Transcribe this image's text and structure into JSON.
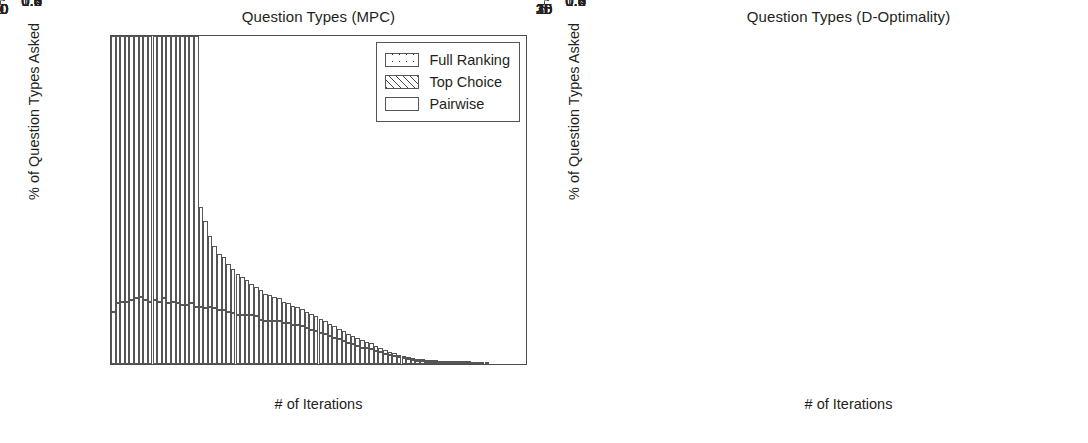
{
  "figure": {
    "width": 1088,
    "height": 443,
    "background": "#ffffff",
    "ink_color": "#231f20",
    "axis_color": "#4d4d4d"
  },
  "chart_data": [
    {
      "id": "mpc",
      "type": "bar",
      "stacked": true,
      "title": "Question Types (MPC)",
      "xlabel": "# of Iterations",
      "ylabel": "% of Question Types Asked",
      "xlim": [
        0,
        90
      ],
      "ylim": [
        0.0,
        1.0
      ],
      "xticks": [
        0,
        10,
        20,
        30,
        40,
        50,
        60,
        70,
        80,
        90
      ],
      "xticklabels": [
        "0",
        "10",
        "20",
        "30",
        "40",
        "50",
        "60",
        "70",
        "80",
        "90"
      ],
      "yticks": [
        0.0,
        0.2,
        0.4,
        0.6,
        0.8,
        1.0
      ],
      "yticklabels": [
        "0.0",
        "0.2",
        "0.4",
        "0.6",
        "0.8",
        "1.0"
      ],
      "grid": false,
      "legend_position": "upper right",
      "legend": [
        "Full Ranking",
        "Top Choice",
        "Pairwise"
      ],
      "x": [
        0,
        1,
        2,
        3,
        4,
        5,
        6,
        7,
        8,
        9,
        10,
        11,
        12,
        13,
        14,
        15,
        16,
        17,
        18,
        19,
        20,
        21,
        22,
        23,
        24,
        25,
        26,
        27,
        28,
        29,
        30,
        31,
        32,
        33,
        34,
        35,
        36,
        37,
        38,
        39,
        40,
        41,
        42,
        43,
        44,
        45,
        46,
        47,
        48,
        49,
        50,
        51,
        52,
        53,
        54,
        55,
        56,
        57,
        58,
        59,
        60,
        61,
        62,
        63,
        64,
        65,
        66,
        67,
        68,
        69,
        70,
        71,
        72,
        73,
        74,
        75,
        76,
        77,
        78,
        79,
        80,
        81
      ],
      "series": [
        {
          "name": "Pairwise",
          "pattern": "blank",
          "values": [
            0.16,
            0.185,
            0.19,
            0.19,
            0.195,
            0.2,
            0.205,
            0.195,
            0.19,
            0.195,
            0.19,
            0.2,
            0.185,
            0.19,
            0.185,
            0.18,
            0.18,
            0.185,
            0.175,
            0.175,
            0.17,
            0.175,
            0.17,
            0.165,
            0.165,
            0.16,
            0.155,
            0.15,
            0.15,
            0.15,
            0.15,
            0.145,
            0.135,
            0.13,
            0.13,
            0.13,
            0.13,
            0.125,
            0.125,
            0.12,
            0.12,
            0.115,
            0.11,
            0.105,
            0.1,
            0.095,
            0.09,
            0.085,
            0.08,
            0.075,
            0.07,
            0.065,
            0.06,
            0.055,
            0.05,
            0.048,
            0.045,
            0.04,
            0.036,
            0.032,
            0.028,
            0.024,
            0.02,
            0.018,
            0.015,
            0.012,
            0.01,
            0.008,
            0.007,
            0.006,
            0.005,
            0.004,
            0.004,
            0.003,
            0.003,
            0.002,
            0.002,
            0.002,
            0.001,
            0.001,
            0.001,
            0.001
          ]
        },
        {
          "name": "Top Choice",
          "pattern": "hatch",
          "values": [
            0.0,
            0.0,
            0.0,
            0.0,
            0.0,
            0.0,
            0.0,
            0.0,
            0.0,
            0.0,
            0.0,
            0.0,
            0.0,
            0.0,
            0.0,
            0.0,
            0.0,
            0.0,
            0.0,
            0.0,
            0.0,
            0.0,
            0.0,
            0.0,
            0.0,
            0.0,
            0.0,
            0.0,
            0.0,
            0.0,
            0.0,
            0.0,
            0.0,
            0.0,
            0.0,
            0.0,
            0.0,
            0.0,
            0.0,
            0.0,
            0.0,
            0.0,
            0.0,
            0.0,
            0.0,
            0.0,
            0.0,
            0.0,
            0.0,
            0.0,
            0.0,
            0.0,
            0.0,
            0.0,
            0.0,
            0.0,
            0.0,
            0.0,
            0.0,
            0.0,
            0.0,
            0.0,
            0.0,
            0.0,
            0.0,
            0.0,
            0.0,
            0.0,
            0.0,
            0.0,
            0.0,
            0.0,
            0.0,
            0.0,
            0.0,
            0.0,
            0.0,
            0.0,
            0.0,
            0.0,
            0.0,
            0.0
          ]
        },
        {
          "name": "Full Ranking",
          "pattern": "dots",
          "values": [
            0.84,
            0.815,
            0.81,
            0.81,
            0.805,
            0.8,
            0.795,
            0.805,
            0.81,
            0.805,
            0.81,
            0.8,
            0.815,
            0.81,
            0.815,
            0.82,
            0.82,
            0.815,
            0.825,
            0.305,
            0.265,
            0.215,
            0.19,
            0.17,
            0.16,
            0.145,
            0.135,
            0.125,
            0.115,
            0.105,
            0.095,
            0.09,
            0.09,
            0.085,
            0.08,
            0.075,
            0.07,
            0.065,
            0.06,
            0.058,
            0.055,
            0.052,
            0.05,
            0.048,
            0.045,
            0.042,
            0.04,
            0.038,
            0.035,
            0.033,
            0.03,
            0.028,
            0.026,
            0.024,
            0.022,
            0.02,
            0.018,
            0.016,
            0.014,
            0.012,
            0.01,
            0.009,
            0.008,
            0.007,
            0.006,
            0.005,
            0.004,
            0.004,
            0.003,
            0.003,
            0.002,
            0.002,
            0.002,
            0.001,
            0.001,
            0.001,
            0.001,
            0.001,
            0.001,
            0.0,
            0.0,
            0.0
          ]
        }
      ]
    },
    {
      "id": "d-optimality",
      "type": "bar",
      "stacked": true,
      "title": "Question Types (D-Optimality)",
      "xlabel": "# of Iterations",
      "ylabel": "% of Question Types Asked",
      "xlim": [
        0,
        35
      ],
      "ylim": [
        0.0,
        1.0
      ],
      "xticks": [
        0,
        5,
        10,
        15,
        20,
        25,
        30,
        35
      ],
      "xticklabels": [
        "0",
        "5",
        "10",
        "15",
        "20",
        "25",
        "30",
        "35"
      ],
      "yticks": [
        0.0,
        0.2,
        0.4,
        0.6,
        0.8,
        1.0
      ],
      "yticklabels": [
        "0.0",
        "0.2",
        "0.4",
        "0.6",
        "0.8",
        "1.0"
      ],
      "grid": false,
      "legend_position": "upper right",
      "legend": [
        "Full Ranking",
        "Top Choice",
        "Pairwise"
      ],
      "x": [
        0,
        1,
        2,
        3,
        4,
        5,
        6,
        7,
        8,
        9,
        10,
        11,
        12,
        13,
        14,
        15,
        16,
        17,
        18
      ],
      "series": [
        {
          "name": "Pairwise",
          "pattern": "blank",
          "values": [
            0.0,
            0.0,
            0.0,
            0.0,
            0.0,
            0.0,
            0.0,
            0.0,
            0.0,
            0.0,
            0.0,
            0.0,
            0.0,
            0.0,
            0.0,
            0.0,
            0.0,
            0.0,
            0.0
          ]
        },
        {
          "name": "Top Choice",
          "pattern": "hatch",
          "values": [
            0.0,
            0.0,
            0.0,
            0.0,
            0.0,
            0.0,
            0.0,
            0.0,
            0.0,
            0.0,
            0.0,
            0.0,
            0.0,
            0.0,
            0.0,
            0.0,
            0.0,
            0.0,
            0.0
          ]
        },
        {
          "name": "Full Ranking",
          "pattern": "dots",
          "values": [
            1.0,
            1.0,
            1.0,
            1.0,
            1.0,
            1.0,
            1.0,
            1.0,
            1.0,
            1.0,
            1.0,
            1.0,
            1.0,
            1.0,
            1.0,
            1.0,
            1.0,
            1.0,
            1.0
          ]
        }
      ]
    }
  ],
  "legend_entries": [
    {
      "label": "Full Ranking",
      "pattern": "dots"
    },
    {
      "label": "Top Choice",
      "pattern": "hatch"
    },
    {
      "label": "Pairwise",
      "pattern": "blank"
    }
  ]
}
